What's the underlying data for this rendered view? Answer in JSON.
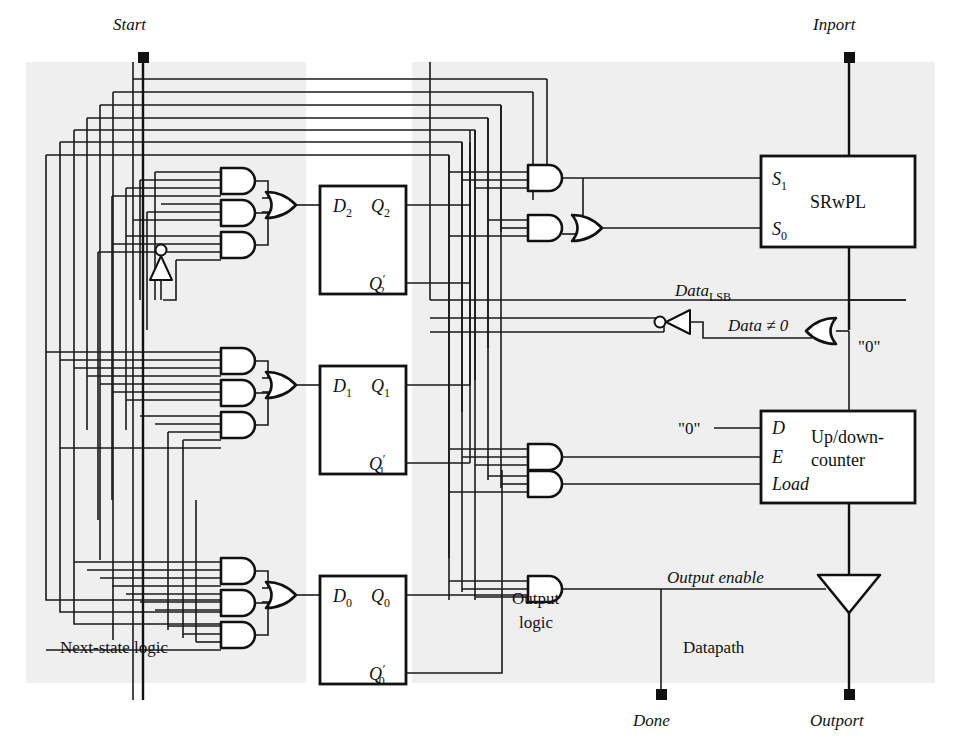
{
  "figure": {
    "kind": "digital-logic-schematic",
    "title_visible": false,
    "width": 962,
    "height": 748
  },
  "colors": {
    "panel_fill": "#efefef",
    "wire": "#1a1a1a",
    "gate_fill": "#ffffff",
    "gate_stroke": "#111111",
    "page_bg": "#ffffff"
  },
  "regions": [
    {
      "id": "next-state-logic",
      "label": "Next-state logic",
      "label_x": 127,
      "label_y": 648
    },
    {
      "id": "output-logic",
      "label_line1": "Output",
      "label_line2": "logic",
      "label_x": 545,
      "label_y": 617
    },
    {
      "id": "datapath",
      "label": "Datapath",
      "label_x": 718,
      "label_y": 648
    }
  ],
  "terminals": [
    {
      "id": "start",
      "label": "Start",
      "label_x": 141,
      "label_y": 24,
      "x": 143,
      "y": 57,
      "style": "italic"
    },
    {
      "id": "inport",
      "label": "Inport",
      "label_x": 847,
      "label_y": 24,
      "x": 849,
      "y": 57,
      "style": "italic"
    },
    {
      "id": "done",
      "label": "Done",
      "label_x": 659,
      "label_y": 724,
      "x": 661,
      "y": 694,
      "style": "italic"
    },
    {
      "id": "outport",
      "label": "Outport",
      "label_x": 846,
      "label_y": 724,
      "x": 849,
      "y": 694,
      "style": "italic"
    }
  ],
  "blocks": [
    {
      "id": "ff-d2",
      "title": "",
      "x": 320,
      "y": 186,
      "w": 86,
      "h": 108,
      "pins": [
        {
          "name": "D2",
          "base": "D",
          "sub": "2",
          "side": "left",
          "at_y": 205
        },
        {
          "name": "Q2",
          "base": "Q",
          "sub": "2",
          "side": "right",
          "at_y": 205
        },
        {
          "name": "Q2'",
          "base": "Q",
          "sub": "2",
          "prime": true,
          "side": "right",
          "at_y": 283
        }
      ]
    },
    {
      "id": "ff-d1",
      "title": "",
      "x": 320,
      "y": 366,
      "w": 86,
      "h": 108,
      "pins": [
        {
          "name": "D1",
          "base": "D",
          "sub": "1",
          "side": "left",
          "at_y": 385
        },
        {
          "name": "Q1",
          "base": "Q",
          "sub": "1",
          "side": "right",
          "at_y": 385
        },
        {
          "name": "Q1'",
          "base": "Q",
          "sub": "1",
          "prime": true,
          "side": "right",
          "at_y": 463
        }
      ]
    },
    {
      "id": "ff-d0",
      "title": "",
      "x": 320,
      "y": 576,
      "w": 86,
      "h": 108,
      "pins": [
        {
          "name": "D0",
          "base": "D",
          "sub": "0",
          "side": "left",
          "at_y": 595
        },
        {
          "name": "Q0",
          "base": "Q",
          "sub": "0",
          "side": "right",
          "at_y": 595
        },
        {
          "name": "Q0'",
          "base": "Q",
          "sub": "0",
          "prime": true,
          "side": "right",
          "at_y": 673
        }
      ]
    },
    {
      "id": "srwpl",
      "title": "SRwPL",
      "x": 761,
      "y": 156,
      "w": 154,
      "h": 91,
      "pins": [
        {
          "name": "S1",
          "base": "S",
          "sub": "1",
          "side": "left",
          "at_y": 178
        },
        {
          "name": "S0",
          "base": "S",
          "sub": "0",
          "side": "left",
          "at_y": 228
        }
      ]
    },
    {
      "id": "counter",
      "title_line1": "Up/down-",
      "title_line2": "counter",
      "x": 761,
      "y": 411,
      "w": 154,
      "h": 92,
      "pins": [
        {
          "name": "D",
          "side": "left",
          "at_y": 428
        },
        {
          "name": "E",
          "side": "left",
          "at_y": 457
        },
        {
          "name": "Load",
          "side": "left",
          "at_y": 484
        }
      ]
    }
  ],
  "signal_labels": [
    {
      "id": "data-lsb",
      "text": "Data",
      "subscript": "LSB",
      "x": 690,
      "y": 291,
      "style": "italic"
    },
    {
      "id": "data-not-zero",
      "text": "Data ≠ 0",
      "x": 737,
      "y": 325,
      "style": "italic"
    },
    {
      "id": "output-enable",
      "text": "Output enable",
      "x": 714,
      "y": 579,
      "style": "italic"
    },
    {
      "id": "const-zero-or",
      "text": "\"0\"",
      "x": 869,
      "y": 345,
      "style": "roman"
    },
    {
      "id": "const-zero-d",
      "text": "\"0\"",
      "x": 692,
      "y": 434,
      "style": "roman"
    }
  ],
  "gates": [
    {
      "id": "and-d2-a",
      "type": "AND",
      "x": 219,
      "y": 168,
      "inputs": 4
    },
    {
      "id": "and-d2-b",
      "type": "AND",
      "x": 219,
      "y": 200,
      "inputs": 4
    },
    {
      "id": "and-d2-c",
      "type": "AND",
      "x": 219,
      "y": 232,
      "inputs": 4
    },
    {
      "id": "or-d2",
      "type": "OR",
      "x": 270,
      "y": 205,
      "inputs": 3
    },
    {
      "id": "and-d1-a",
      "type": "AND",
      "x": 219,
      "y": 348,
      "inputs": 4
    },
    {
      "id": "and-d1-b",
      "type": "AND",
      "x": 219,
      "y": 380,
      "inputs": 4
    },
    {
      "id": "and-d1-c",
      "type": "AND",
      "x": 219,
      "y": 412,
      "inputs": 4
    },
    {
      "id": "or-d1",
      "type": "OR",
      "x": 270,
      "y": 385,
      "inputs": 3
    },
    {
      "id": "and-d0-a",
      "type": "AND",
      "x": 219,
      "y": 558,
      "inputs": 4
    },
    {
      "id": "and-d0-b",
      "type": "AND",
      "x": 219,
      "y": 590,
      "inputs": 4
    },
    {
      "id": "and-d0-c",
      "type": "AND",
      "x": 219,
      "y": 622,
      "inputs": 4
    },
    {
      "id": "or-d0",
      "type": "OR",
      "x": 270,
      "y": 595,
      "inputs": 3
    },
    {
      "id": "and-s1",
      "type": "AND",
      "x": 528,
      "y": 178,
      "inputs": 2
    },
    {
      "id": "and-s0",
      "type": "AND",
      "x": 528,
      "y": 228,
      "inputs": 3
    },
    {
      "id": "or-s0",
      "type": "OR",
      "x": 578,
      "y": 228,
      "inputs": 2
    },
    {
      "id": "and-count-e",
      "type": "AND",
      "x": 528,
      "y": 457,
      "inputs": 3
    },
    {
      "id": "and-count-load",
      "type": "AND",
      "x": 528,
      "y": 484,
      "inputs": 3
    },
    {
      "id": "and-outen",
      "type": "AND",
      "x": 528,
      "y": 589,
      "inputs": 3
    },
    {
      "id": "or-datazero",
      "type": "OR",
      "x": 826,
      "y": 330,
      "orientation": "left"
    },
    {
      "id": "inv-start",
      "type": "INVERTER",
      "x": 161,
      "y": 258,
      "orientation": "up"
    },
    {
      "id": "inv-data",
      "type": "INVERTER",
      "x": 672,
      "y": 322,
      "orientation": "left"
    },
    {
      "id": "tristate-out",
      "type": "TRISTATE-BUFFER",
      "x": 849,
      "y": 589,
      "orientation": "down"
    }
  ]
}
